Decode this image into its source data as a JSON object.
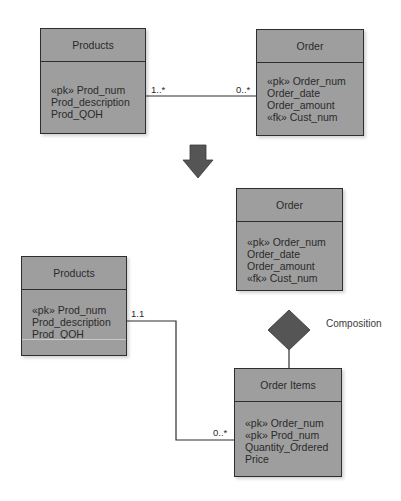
{
  "top": {
    "products": {
      "title": "Products",
      "attributes": [
        "«pk» Prod_num",
        "Prod_description",
        "Prod_QOH"
      ]
    },
    "order": {
      "title": "Order",
      "attributes": [
        "«pk» Order_num",
        "Order_date",
        "Order_amount",
        "«fk» Cust_num"
      ]
    },
    "relationship": {
      "products_multiplicity": "1..*",
      "order_multiplicity": "0..*"
    }
  },
  "transform_arrow": "down-arrow-icon",
  "bottom": {
    "order": {
      "title": "Order",
      "attributes": [
        "«pk» Order_num",
        "Order_date",
        "Order_amount",
        "«fk» Cust_num"
      ]
    },
    "composition_label": "Composition",
    "products": {
      "title": "Products",
      "attributes": [
        "«pk» Prod_num",
        "Prod_description",
        "Prod_QOH"
      ]
    },
    "order_items": {
      "title": "Order Items",
      "attributes": [
        "«pk» Order_num",
        "«pk» Prod_num",
        "Quantity_Ordered",
        "Price"
      ]
    },
    "relationship": {
      "products_multiplicity": "1.1",
      "order_items_multiplicity": "0..*"
    }
  },
  "colors": {
    "entity_fill": "#9e9e9e",
    "stroke": "#2e2e2e",
    "arrow_fill": "#555555",
    "diamond_fill": "#555555"
  }
}
